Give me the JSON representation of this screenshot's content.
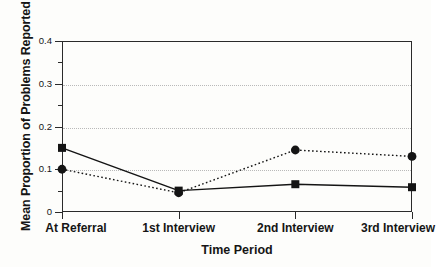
{
  "chart_data": {
    "type": "line",
    "title": "",
    "xlabel": "Time Period",
    "ylabel": "Mean Proportion of Problems Reported",
    "categories": [
      "At Referral",
      "1st Interview",
      "2nd Interview",
      "3rd Interview"
    ],
    "series": [
      {
        "name": "solid-line-square-markers",
        "marker": "square",
        "linestyle": "solid",
        "color": "#141414",
        "values": [
          0.15,
          0.05,
          0.065,
          0.058
        ]
      },
      {
        "name": "dotted-line-circle-markers",
        "marker": "circle",
        "linestyle": "dotted",
        "color": "#141414",
        "values": [
          0.1,
          0.045,
          0.145,
          0.13
        ]
      }
    ],
    "ylim": [
      0,
      0.4
    ],
    "y_major_ticks": [
      0,
      0.1,
      0.2,
      0.3,
      0.4
    ],
    "y_tick_labels": [
      "0",
      "0.1",
      "0.2",
      "0.3",
      "0.4"
    ],
    "y_minor_ticks": [
      0.05,
      0.15,
      0.25,
      0.35
    ],
    "grid": true,
    "gridlines_at": [
      0.1,
      0.2,
      0.3
    ],
    "legend": "none",
    "legend_position": "none"
  },
  "axes": {
    "y_title": "Mean Proportion of Problems Reported",
    "x_title": "Time Period"
  },
  "colors": {
    "ink": "#141414",
    "frame": "#2a2a2a",
    "grid": "#b9b9b9",
    "background": "#fdfdfb"
  }
}
